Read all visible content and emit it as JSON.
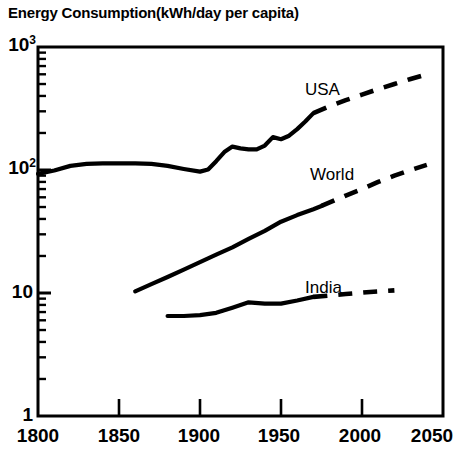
{
  "chart_data": {
    "type": "line",
    "title": "Energy Consumption(kWh/day per capita)",
    "xlabel": "",
    "ylabel": "",
    "yscale": "log",
    "xlim": [
      1800,
      2050
    ],
    "ylim": [
      1,
      1000
    ],
    "grid": false,
    "legend_position": "inline-annotations",
    "y_tick_labels": [
      "10",
      "10",
      "10",
      "1"
    ],
    "y_tick_exponents": [
      "3",
      "2",
      "",
      ""
    ],
    "y_tick_values": [
      1000,
      100,
      10,
      1
    ],
    "x_tick_labels": [
      "1800",
      "1850",
      "1900",
      "1950",
      "2000",
      "2050"
    ],
    "x_tick_values": [
      1800,
      1850,
      1900,
      1950,
      2000,
      2050
    ],
    "series": [
      {
        "name": "USA",
        "label": "USA",
        "historical_x": [
          1800,
          1810,
          1820,
          1830,
          1840,
          1850,
          1860,
          1870,
          1880,
          1890,
          1900,
          1905,
          1910,
          1915,
          1920,
          1925,
          1930,
          1935,
          1940,
          1945,
          1950,
          1955,
          1960,
          1965,
          1970
        ],
        "historical_y": [
          93,
          99,
          108,
          112,
          113,
          113,
          113,
          112,
          108,
          102,
          97,
          101,
          118,
          140,
          155,
          150,
          147,
          147,
          158,
          185,
          178,
          190,
          215,
          248,
          290
        ],
        "projected_x": [
          1970,
          1980,
          1990,
          2000,
          2010,
          2020,
          2030,
          2040
        ],
        "projected_y": [
          290,
          330,
          370,
          410,
          455,
          500,
          550,
          600
        ],
        "style_historical": "solid",
        "style_projected": "dashed"
      },
      {
        "name": "World",
        "label": "World",
        "historical_x": [
          1860,
          1870,
          1880,
          1890,
          1900,
          1910,
          1920,
          1930,
          1940,
          1950,
          1960,
          1970,
          1975
        ],
        "historical_y": [
          10.3,
          11.8,
          13.5,
          15.5,
          17.8,
          20.5,
          23.5,
          27.5,
          32,
          38,
          43,
          48,
          51
        ],
        "projected_x": [
          1975,
          1990,
          2000,
          2010,
          2020,
          2030,
          2040
        ],
        "projected_y": [
          51,
          62,
          70,
          80,
          90,
          100,
          110
        ],
        "style_historical": "solid",
        "style_projected": "dashed"
      },
      {
        "name": "India",
        "label": "India",
        "historical_x": [
          1880,
          1890,
          1900,
          1910,
          1920,
          1930,
          1940,
          1950,
          1960,
          1970
        ],
        "historical_y": [
          6.5,
          6.5,
          6.6,
          6.9,
          7.6,
          8.4,
          8.2,
          8.2,
          8.7,
          9.3
        ],
        "projected_x": [
          1970,
          1990,
          2005,
          2020
        ],
        "projected_y": [
          9.3,
          9.8,
          10.2,
          10.5
        ],
        "style_historical": "solid",
        "style_projected": "dashed"
      }
    ],
    "line_color": "#000000",
    "axis_color": "#000000"
  },
  "annotations": {
    "usa": "USA",
    "world": "World",
    "india": "India"
  },
  "axis": {
    "y_labels": [
      {
        "base": "10",
        "exp": "3"
      },
      {
        "base": "10",
        "exp": "2"
      },
      {
        "base": "10",
        "exp": ""
      },
      {
        "base": "1",
        "exp": ""
      }
    ],
    "x_labels": [
      "1800",
      "1850",
      "1900",
      "1950",
      "2000",
      "2050"
    ]
  }
}
